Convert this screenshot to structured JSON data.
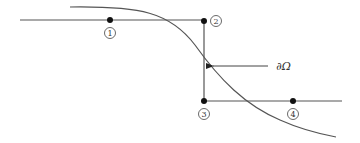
{
  "diagram": {
    "colors": {
      "stroke": "#555555",
      "node": "#111111",
      "background": "#ffffff"
    },
    "boundary_label": "∂Ω",
    "nodes": [
      {
        "id": "1",
        "label": "1"
      },
      {
        "id": "2",
        "label": "2"
      },
      {
        "id": "3",
        "label": "3"
      },
      {
        "id": "4",
        "label": "4"
      }
    ]
  }
}
